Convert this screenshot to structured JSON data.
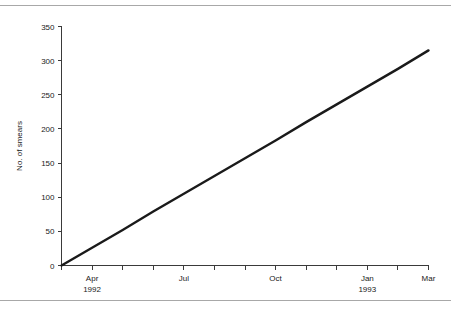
{
  "figure": {
    "background_color": "#ffffff",
    "rule_color": "#a8a8a8",
    "axis_color": "#3a3a3a",
    "line_color": "#1a1a1a"
  },
  "chart_data": {
    "type": "line",
    "title": "",
    "xlabel": "",
    "ylabel": "No. of smears",
    "ylim": [
      0,
      350
    ],
    "yticks": [
      0,
      50,
      100,
      150,
      200,
      250,
      300,
      350
    ],
    "ytick_labels": [
      "0",
      "50",
      "100",
      "150",
      "200",
      "250",
      "300",
      "350"
    ],
    "grid": false,
    "legend": false,
    "x": [
      "Mar 1992",
      "Apr 1992",
      "May 1992",
      "Jun 1992",
      "Jul 1992",
      "Aug 1992",
      "Sep 1992",
      "Oct 1992",
      "Nov 1992",
      "Dec 1992",
      "Jan 1993",
      "Feb 1993",
      "Mar 1993"
    ],
    "xtick_labels": [
      {
        "index": 0,
        "line1": "",
        "line2": ""
      },
      {
        "index": 1,
        "line1": "Apr",
        "line2": "1992"
      },
      {
        "index": 2,
        "line1": "",
        "line2": ""
      },
      {
        "index": 3,
        "line1": "",
        "line2": ""
      },
      {
        "index": 4,
        "line1": "Jul",
        "line2": ""
      },
      {
        "index": 5,
        "line1": "",
        "line2": ""
      },
      {
        "index": 6,
        "line1": "",
        "line2": ""
      },
      {
        "index": 7,
        "line1": "Oct",
        "line2": ""
      },
      {
        "index": 8,
        "line1": "",
        "line2": ""
      },
      {
        "index": 9,
        "line1": "",
        "line2": ""
      },
      {
        "index": 10,
        "line1": "Jan",
        "line2": "1993"
      },
      {
        "index": 11,
        "line1": "",
        "line2": ""
      },
      {
        "index": 12,
        "line1": "Mar",
        "line2": ""
      }
    ],
    "series": [
      {
        "name": "Cumulative smears",
        "values": [
          0,
          26,
          52,
          79,
          105,
          131,
          157,
          183,
          210,
          236,
          262,
          288,
          315
        ]
      }
    ]
  }
}
